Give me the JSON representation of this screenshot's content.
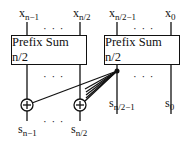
{
  "inputs": [
    {
      "base": "x",
      "sub": "n−1"
    },
    {
      "base": "x",
      "sub": "n/2"
    },
    {
      "base": "x",
      "sub": "n/2−1"
    },
    {
      "base": "x",
      "sub": "0"
    }
  ],
  "boxes": [
    {
      "label": "Prefix Sum n/2"
    },
    {
      "label": "Prefix Sum n/2"
    }
  ],
  "outputs": [
    {
      "base": "s",
      "sub": "n−1"
    },
    {
      "base": "s",
      "sub": "n/2"
    },
    {
      "base": "s",
      "sub": "n/2−1"
    },
    {
      "base": "s",
      "sub": "0"
    }
  ],
  "ellipsis": "· · ·",
  "adder_symbol": "+"
}
